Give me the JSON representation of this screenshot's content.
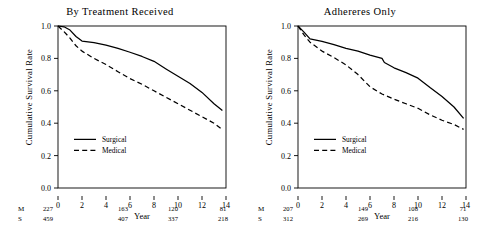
{
  "figure": {
    "background": "#ffffff",
    "ink": "#000000"
  },
  "chart_data": [
    {
      "type": "line",
      "panel": "left",
      "title": "By Treatment Received",
      "xlabel": "Year",
      "ylabel": "Cumulative Survival Rate",
      "xlim": [
        0,
        14
      ],
      "ylim": [
        0.0,
        1.0
      ],
      "xticks": [
        0,
        2,
        4,
        6,
        8,
        10,
        12,
        14
      ],
      "xticklabels": [
        "0",
        "2",
        "4",
        "6",
        "8",
        "10",
        "12",
        "14"
      ],
      "yticks": [
        0.0,
        0.2,
        0.4,
        0.6,
        0.8,
        1.0
      ],
      "yticklabels": [
        "0.0",
        "0.2",
        "0.4",
        "0.6",
        "0.8",
        "1.0"
      ],
      "grid": false,
      "legend_position": "lower-left-inside",
      "series": [
        {
          "name": "Surgical",
          "style": "solid",
          "x": [
            0.0,
            0.5,
            1.0,
            1.5,
            2.0,
            3.0,
            4.0,
            5.0,
            6.0,
            7.0,
            8.0,
            9.0,
            10.0,
            11.0,
            12.0,
            13.0,
            13.7
          ],
          "y": [
            1.0,
            0.995,
            0.975,
            0.935,
            0.907,
            0.898,
            0.882,
            0.862,
            0.838,
            0.812,
            0.782,
            0.735,
            0.69,
            0.645,
            0.59,
            0.52,
            0.478
          ]
        },
        {
          "name": "Medical",
          "style": "dashed",
          "x": [
            0.0,
            0.5,
            1.0,
            1.5,
            2.0,
            3.0,
            4.0,
            5.0,
            6.0,
            7.0,
            8.0,
            9.0,
            10.0,
            11.0,
            12.0,
            13.0,
            13.7
          ],
          "y": [
            1.0,
            0.965,
            0.925,
            0.878,
            0.845,
            0.8,
            0.762,
            0.718,
            0.675,
            0.64,
            0.6,
            0.56,
            0.52,
            0.48,
            0.44,
            0.4,
            0.36
          ]
        }
      ],
      "risk_table": {
        "row_labels": [
          "M",
          "S"
        ],
        "x_positions": [
          0,
          6,
          10,
          14
        ],
        "rows": [
          {
            "label": "M",
            "values": [
              "227",
              "163",
              "120",
              "81"
            ]
          },
          {
            "label": "S",
            "values": [
              "459",
              "407",
              "337",
              "218"
            ]
          }
        ]
      }
    },
    {
      "type": "line",
      "panel": "right",
      "title": "Adhereres Only",
      "xlabel": "Year",
      "ylabel": "Cumulative Survival Rate",
      "xlim": [
        0,
        14
      ],
      "ylim": [
        0.0,
        1.0
      ],
      "xticks": [
        0,
        2,
        4,
        6,
        8,
        10,
        12,
        14
      ],
      "xticklabels": [
        "0",
        "2",
        "4",
        "6",
        "8",
        "10",
        "12",
        "14"
      ],
      "yticks": [
        0.0,
        0.2,
        0.4,
        0.6,
        0.8,
        1.0
      ],
      "yticklabels": [
        "0.0",
        "0.2",
        "0.4",
        "0.6",
        "0.8",
        "1.0"
      ],
      "grid": false,
      "legend_position": "lower-left-inside",
      "series": [
        {
          "name": "Surgical",
          "style": "solid",
          "x": [
            0.0,
            0.5,
            1.0,
            2.0,
            3.0,
            4.0,
            5.0,
            6.0,
            7.0,
            7.2,
            8.0,
            9.0,
            10.0,
            11.0,
            12.0,
            13.0,
            13.8
          ],
          "y": [
            1.0,
            0.962,
            0.92,
            0.905,
            0.885,
            0.862,
            0.845,
            0.82,
            0.8,
            0.775,
            0.742,
            0.712,
            0.678,
            0.62,
            0.565,
            0.5,
            0.43
          ]
        },
        {
          "name": "Medical",
          "style": "dashed",
          "x": [
            0.0,
            0.5,
            1.0,
            2.0,
            3.0,
            4.0,
            5.0,
            6.0,
            7.0,
            8.0,
            9.0,
            10.0,
            11.0,
            12.0,
            13.0,
            13.8
          ],
          "y": [
            1.0,
            0.945,
            0.9,
            0.845,
            0.805,
            0.76,
            0.7,
            0.625,
            0.58,
            0.548,
            0.52,
            0.492,
            0.452,
            0.418,
            0.392,
            0.362
          ]
        }
      ],
      "risk_table": {
        "row_labels": [
          "M",
          "S"
        ],
        "x_positions": [
          0,
          6,
          10,
          14
        ],
        "rows": [
          {
            "label": "M",
            "values": [
              "207",
              "149",
              "108",
              "71"
            ]
          },
          {
            "label": "S",
            "values": [
              "312",
              "269",
              "216",
              "130"
            ]
          }
        ]
      }
    }
  ],
  "legend": {
    "surgical_label": "Surgical",
    "medical_label": "Medical"
  }
}
